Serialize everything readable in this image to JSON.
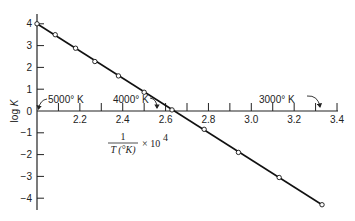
{
  "chart_data": {
    "type": "line",
    "title": "",
    "xlabel": "1/T(°K) × 10^4",
    "xlabel_parts": {
      "numerator": "1",
      "denominator": "T (°K)",
      "suffix": "× 10",
      "exponent": "4"
    },
    "ylabel": "log K",
    "xlim": [
      2.0,
      3.4
    ],
    "ylim": [
      -4.5,
      4.5
    ],
    "grid": false,
    "x_ticks": [
      2.1,
      2.2,
      2.3,
      2.4,
      2.5,
      2.6,
      2.7,
      2.8,
      2.9,
      3.0,
      3.1,
      3.2,
      3.3,
      3.4
    ],
    "x_tick_labels": [
      {
        "value": 2.2,
        "label": "2.2"
      },
      {
        "value": 2.4,
        "label": "2.4"
      },
      {
        "value": 2.6,
        "label": "2.6"
      },
      {
        "value": 2.8,
        "label": "2.8"
      },
      {
        "value": 3.0,
        "label": "3.0"
      },
      {
        "value": 3.2,
        "label": "3.2"
      },
      {
        "value": 3.4,
        "label": "3.4"
      }
    ],
    "y_ticks": [
      {
        "value": 4,
        "label": "4"
      },
      {
        "value": 3,
        "label": "3"
      },
      {
        "value": 2,
        "label": "2"
      },
      {
        "value": 1,
        "label": "1"
      },
      {
        "value": 0,
        "label": "0"
      },
      {
        "value": -1,
        "label": "−1"
      },
      {
        "value": -2,
        "label": "−2"
      },
      {
        "value": -3,
        "label": "−3"
      },
      {
        "value": -4,
        "label": "−4"
      }
    ],
    "series": [
      {
        "name": "log K",
        "marker": "open-circle",
        "x": [
          2.0,
          2.085,
          2.18,
          2.27,
          2.38,
          2.5,
          2.63,
          2.78,
          2.94,
          3.13,
          3.33
        ],
        "y": [
          4.0,
          3.5,
          2.88,
          2.27,
          1.61,
          0.86,
          0.05,
          -0.84,
          -1.9,
          -3.05,
          -4.3
        ]
      }
    ],
    "annotations": [
      {
        "text": "5000° K",
        "points_to_x": 2.0
      },
      {
        "text": "4000° K",
        "points_to_x": 2.5
      },
      {
        "text": "3000° K",
        "points_to_x": 3.333
      }
    ],
    "legend": null
  }
}
